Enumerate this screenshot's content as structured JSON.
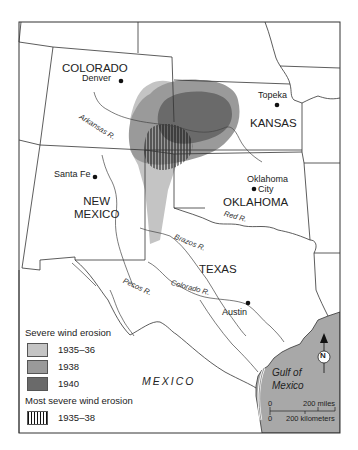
{
  "map": {
    "states": [
      {
        "name": "COLORADO"
      },
      {
        "name": "KANSAS"
      },
      {
        "name": "NEW\nMEXICO",
        "line1": "NEW",
        "line2": "MEXICO"
      },
      {
        "name": "OKLAHOMA"
      },
      {
        "name": "TEXAS"
      }
    ],
    "cities": [
      {
        "name": "Denver"
      },
      {
        "name": "Topeka"
      },
      {
        "name": "Santa Fe"
      },
      {
        "name": "Oklahoma City",
        "line1": "Oklahoma",
        "line2": "City"
      },
      {
        "name": "Austin"
      }
    ],
    "rivers": [
      {
        "name": "Arkansas R."
      },
      {
        "name": "Red R."
      },
      {
        "name": "Brazos R."
      },
      {
        "name": "Colorado R."
      },
      {
        "name": "Pecos R."
      }
    ],
    "country": "MEXICO",
    "water": {
      "line1": "Gulf of",
      "line2": "Mexico"
    },
    "north_arrow": "N",
    "scale": {
      "zero": "0",
      "miles": "200 miles",
      "km": "200 kilometers"
    },
    "colors": {
      "erosion_1935_36": "#c4c4c4",
      "erosion_1938": "#9a9a9a",
      "erosion_1940": "#6a6a6a",
      "gulf": "#a8a8a8",
      "border": "#333333"
    }
  },
  "legend": {
    "title_severe": "Severe wind erosion",
    "items": [
      {
        "label": "1935–36"
      },
      {
        "label": "1938"
      },
      {
        "label": "1940"
      }
    ],
    "title_most_severe": "Most severe wind erosion",
    "hatched": {
      "label": "1935–38"
    }
  }
}
